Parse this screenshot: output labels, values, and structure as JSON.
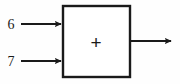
{
  "diagram": {
    "type": "block-diagram",
    "title": "",
    "background_color": "#fefefe",
    "stroke_color": "#1a1a1a",
    "block": {
      "operator_symbol": "+",
      "operator_name": "plus-sign",
      "fill_color": "#ffffff",
      "border_color": "#1a1a1a",
      "border_width": 2,
      "x": 62,
      "y": 5,
      "width": 69,
      "height": 73
    },
    "inputs": [
      {
        "label": "6",
        "name": "input-operand-1",
        "label_x": 11,
        "label_y": 24,
        "line_start_x": 21,
        "line_end_x": 62,
        "line_y": 24
      },
      {
        "label": "7",
        "name": "input-operand-2",
        "label_x": 11,
        "label_y": 61,
        "line_start_x": 21,
        "line_end_x": 62,
        "line_y": 61
      }
    ],
    "outputs": [
      {
        "label": "",
        "name": "output-result",
        "line_start_x": 131,
        "line_end_x": 173,
        "line_y": 41
      }
    ],
    "operator_position": {
      "x": 96,
      "y": 42
    }
  }
}
